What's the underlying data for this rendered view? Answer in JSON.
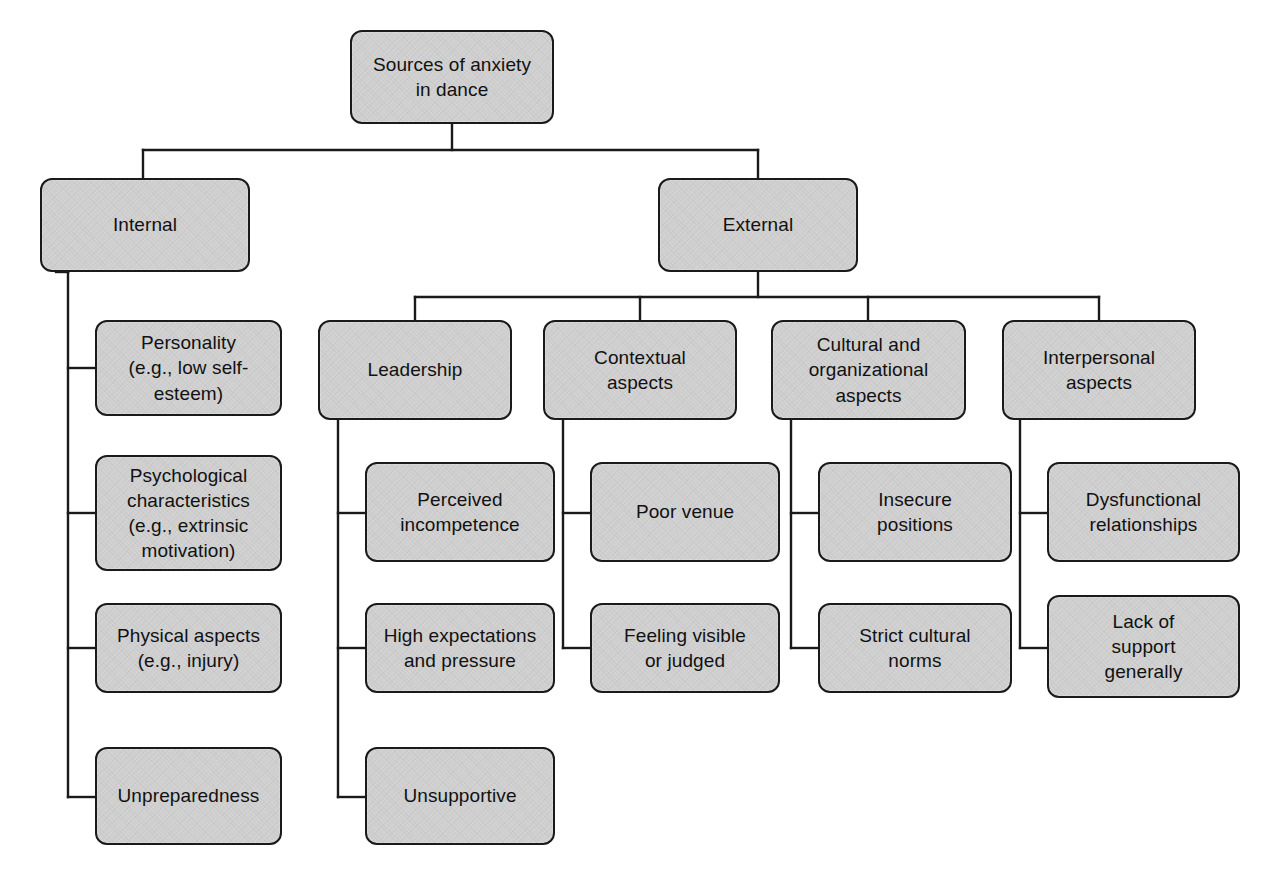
{
  "diagram": {
    "title": "Sources of anxiety in dance",
    "type": "hierarchical-tree",
    "colors": {
      "node_fill": "#d2d2d2",
      "node_border": "#1a1a1a",
      "connector": "#1a1a1a",
      "background": "#ffffff",
      "text": "#111111"
    }
  },
  "nodes": {
    "root": {
      "label": "Sources of anxiety\nin dance"
    },
    "internal": {
      "label": "Internal"
    },
    "external": {
      "label": "External"
    },
    "leadership": {
      "label": "Leadership"
    },
    "contextual": {
      "label": "Contextual\naspects"
    },
    "cultural": {
      "label": "Cultural and\norganizational\naspects"
    },
    "interpersonal": {
      "label": "Interpersonal\naspects"
    },
    "personality": {
      "label": "Personality\n(e.g., low self-\nesteem)"
    },
    "psychological": {
      "label": "Psychological\ncharacteristics\n(e.g., extrinsic\nmotivation)"
    },
    "physical": {
      "label": "Physical aspects\n(e.g., injury)"
    },
    "unpreparedness": {
      "label": "Unpreparedness"
    },
    "perceived_incompetence": {
      "label": "Perceived\nincompetence"
    },
    "high_expectations": {
      "label": "High expectations\nand pressure"
    },
    "unsupportive": {
      "label": "Unsupportive"
    },
    "poor_venue": {
      "label": "Poor venue"
    },
    "feeling_visible": {
      "label": "Feeling visible\nor judged"
    },
    "insecure_positions": {
      "label": "Insecure\npositions"
    },
    "strict_cultural_norms": {
      "label": "Strict cultural\nnorms"
    },
    "dysfunctional_relationships": {
      "label": "Dysfunctional\nrelationships"
    },
    "lack_of_support": {
      "label": "Lack of\nsupport\ngenerally"
    }
  }
}
